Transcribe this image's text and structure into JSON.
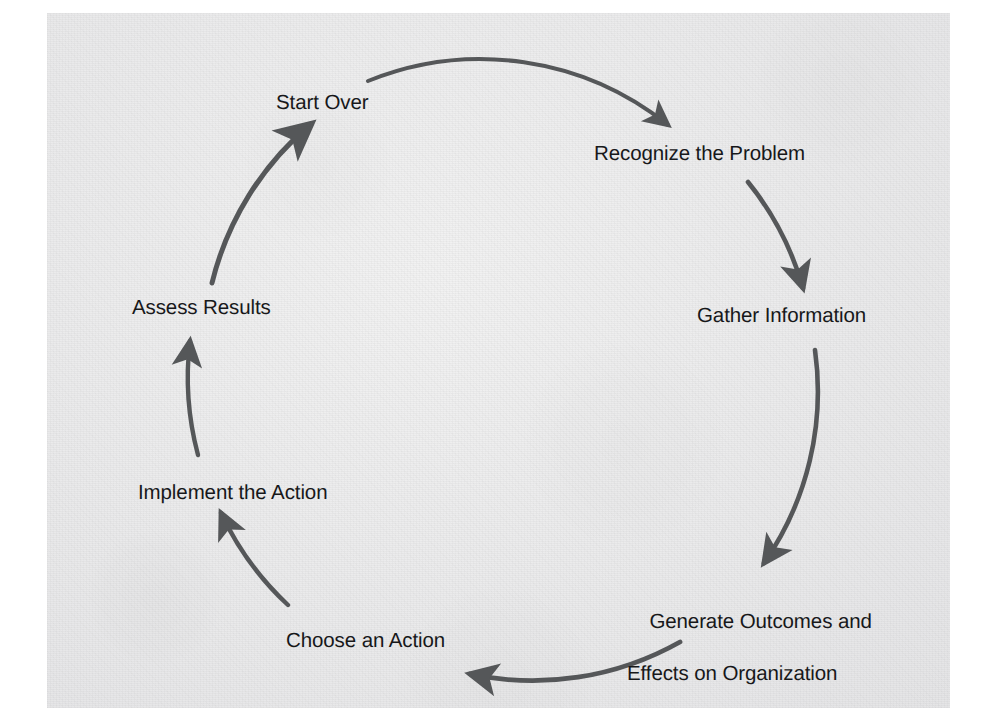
{
  "figure": {
    "kind": "cyclic-process-diagram",
    "direction": "clockwise",
    "background_color": "#ececed",
    "page_color": "#ffffff",
    "arrow_color": "#555759",
    "text_color": "#17181a"
  },
  "nodes": [
    {
      "id": "start-over",
      "label": "Start Over",
      "label_line1": "Start Over",
      "label_line2": "",
      "angle_deg": 270,
      "order": 7
    },
    {
      "id": "recognize",
      "label": "Recognize the Problem",
      "label_line1": "Recognize the Problem",
      "label_line2": "",
      "angle_deg": 315,
      "order": 1
    },
    {
      "id": "gather",
      "label": "Gather Information",
      "label_line1": "Gather Information",
      "label_line2": "",
      "angle_deg": 0,
      "order": 2
    },
    {
      "id": "generate",
      "label": "Generate Outcomes and Effects on Organization",
      "label_line1": "Generate Outcomes and",
      "label_line2": "Effects on Organization",
      "angle_deg": 50,
      "order": 3
    },
    {
      "id": "choose",
      "label": "Choose an Action",
      "label_line1": "Choose an Action",
      "label_line2": "",
      "angle_deg": 115,
      "order": 4
    },
    {
      "id": "implement",
      "label": "Implement the Action",
      "label_line1": "Implement the Action",
      "label_line2": "",
      "angle_deg": 170,
      "order": 5
    },
    {
      "id": "assess",
      "label": "Assess Results",
      "label_line1": "Assess Results",
      "label_line2": "",
      "angle_deg": 205,
      "order": 6
    }
  ],
  "arrows": [
    {
      "id": "arrow-start-to-recognize",
      "from": "start-over",
      "to": "recognize",
      "shape": "arc-clockwise"
    },
    {
      "id": "arrow-recognize-to-gather",
      "from": "recognize",
      "to": "gather",
      "shape": "arc-clockwise"
    },
    {
      "id": "arrow-gather-to-generate",
      "from": "gather",
      "to": "generate",
      "shape": "arc-clockwise"
    },
    {
      "id": "arrow-generate-to-choose",
      "from": "generate",
      "to": "choose",
      "shape": "arc-clockwise"
    },
    {
      "id": "arrow-choose-to-implement",
      "from": "choose",
      "to": "implement",
      "shape": "arc-clockwise"
    },
    {
      "id": "arrow-implement-to-assess",
      "from": "implement",
      "to": "assess",
      "shape": "arc-clockwise"
    },
    {
      "id": "arrow-assess-to-start",
      "from": "assess",
      "to": "start-over",
      "shape": "arc-clockwise"
    }
  ]
}
